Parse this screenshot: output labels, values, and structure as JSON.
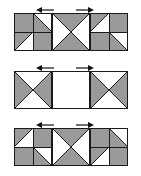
{
  "figure": {
    "background_color": "#ffffff",
    "fill_color": "#9a9a9a",
    "empty_color": "#ffffff",
    "line_color": "#1a1a1a",
    "arrow_color": "#111111",
    "block_size": 38,
    "rows": [
      {
        "id": "row-1",
        "label": "Row 1",
        "top": 2,
        "arrows": [
          {
            "id": "arrow-row1-left",
            "direction": "left",
            "x": 36
          },
          {
            "id": "arrow-row1-right",
            "direction": "right",
            "x": 76
          }
        ],
        "blocks": [
          {
            "id": "row1-block1",
            "name": "block-pinwheel-left",
            "quadrants": [
              {
                "id": "q-tl",
                "type": "solid",
                "fill": "gray"
              },
              {
                "id": "q-tr",
                "type": "diag-tl-br",
                "upper": "white",
                "lower": "gray"
              },
              {
                "id": "q-bl",
                "type": "diag-tr-bl",
                "upper": "gray",
                "lower": "white"
              },
              {
                "id": "q-br",
                "type": "solid",
                "fill": "gray"
              }
            ]
          },
          {
            "id": "row1-block2",
            "name": "block-hourglass-vertical",
            "quadrants": [
              {
                "id": "q-x",
                "type": "x-cross",
                "top": "gray",
                "bottom": "gray",
                "left": "white",
                "right": "white"
              }
            ]
          },
          {
            "id": "row1-block3",
            "name": "block-pinwheel-right",
            "quadrants": [
              {
                "id": "q-tl",
                "type": "diag-tr-bl",
                "upper": "gray",
                "lower": "white"
              },
              {
                "id": "q-tr",
                "type": "solid",
                "fill": "gray"
              },
              {
                "id": "q-bl",
                "type": "solid",
                "fill": "gray"
              },
              {
                "id": "q-br",
                "type": "diag-tl-br",
                "upper": "white",
                "lower": "gray"
              }
            ]
          }
        ]
      },
      {
        "id": "row-2",
        "label": "Row 2",
        "top": 60,
        "arrows": [
          {
            "id": "arrow-row2-left",
            "direction": "left",
            "x": 36
          },
          {
            "id": "arrow-row2-right",
            "direction": "right",
            "x": 76
          }
        ],
        "blocks": [
          {
            "id": "row2-block1",
            "name": "block-hourglass-horizontal",
            "quadrants": [
              {
                "id": "q-x",
                "type": "x-cross",
                "top": "white",
                "bottom": "white",
                "left": "gray",
                "right": "gray"
              }
            ]
          },
          {
            "id": "row2-block2",
            "name": "block-empty",
            "quadrants": [
              {
                "id": "q-empty",
                "type": "solid",
                "fill": "white"
              }
            ]
          },
          {
            "id": "row2-block3",
            "name": "block-hourglass-horizontal",
            "quadrants": [
              {
                "id": "q-x",
                "type": "x-cross",
                "top": "white",
                "bottom": "white",
                "left": "gray",
                "right": "gray"
              }
            ]
          }
        ]
      },
      {
        "id": "row-3",
        "label": "Row 3",
        "top": 117,
        "arrows": [
          {
            "id": "arrow-row3-left",
            "direction": "left",
            "x": 36
          },
          {
            "id": "arrow-row3-right",
            "direction": "right",
            "x": 76
          }
        ],
        "blocks": [
          {
            "id": "row3-block1",
            "name": "block-pinwheel-left",
            "quadrants": [
              {
                "id": "q-tl",
                "type": "diag-tr-bl",
                "upper": "gray",
                "lower": "white"
              },
              {
                "id": "q-tr",
                "type": "solid",
                "fill": "gray"
              },
              {
                "id": "q-bl",
                "type": "solid",
                "fill": "gray"
              },
              {
                "id": "q-br",
                "type": "diag-tl-br",
                "upper": "white",
                "lower": "gray"
              }
            ]
          },
          {
            "id": "row3-block2",
            "name": "block-hourglass-vertical",
            "quadrants": [
              {
                "id": "q-x",
                "type": "x-cross",
                "top": "gray",
                "bottom": "gray",
                "left": "white",
                "right": "white"
              }
            ]
          },
          {
            "id": "row3-block3",
            "name": "block-pinwheel-right",
            "quadrants": [
              {
                "id": "q-tl",
                "type": "solid",
                "fill": "gray"
              },
              {
                "id": "q-tr",
                "type": "diag-tl-br",
                "upper": "white",
                "lower": "gray"
              },
              {
                "id": "q-bl",
                "type": "diag-tr-bl",
                "upper": "gray",
                "lower": "white"
              },
              {
                "id": "q-br",
                "type": "solid",
                "fill": "gray"
              }
            ]
          }
        ]
      }
    ]
  }
}
